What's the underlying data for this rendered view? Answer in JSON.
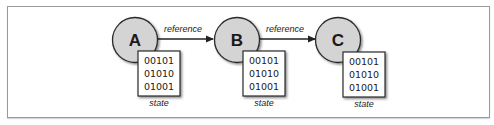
{
  "diagram": {
    "nodes": [
      {
        "id": "A",
        "label": "A",
        "cx": 135,
        "cy": 40,
        "state_rows": [
          "00101",
          "01010",
          "01001"
        ],
        "state_label": "state",
        "box_x": 138,
        "box_y": 51
      },
      {
        "id": "B",
        "label": "B",
        "cx": 237,
        "cy": 40,
        "state_rows": [
          "00101",
          "01010",
          "01001"
        ],
        "state_label": "state",
        "box_x": 243,
        "box_y": 51
      },
      {
        "id": "C",
        "label": "C",
        "cx": 338,
        "cy": 40,
        "state_rows": [
          "00101",
          "01010",
          "01001"
        ],
        "state_label": "state",
        "box_x": 343,
        "box_y": 52
      }
    ],
    "edges": [
      {
        "from": "A",
        "to": "B",
        "label": "reference"
      },
      {
        "from": "B",
        "to": "C",
        "label": "reference"
      }
    ],
    "colors": {
      "node_fill": "#d4d4d4",
      "node_stroke": "#2b2b2b",
      "box_stroke": "#2b2b2b",
      "text": "#222222",
      "frame": "#9a9a9a"
    }
  }
}
